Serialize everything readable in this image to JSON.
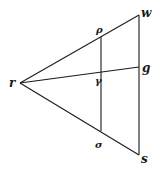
{
  "diagram": {
    "stroke_color": "#1a1a1a",
    "background": "#ffffff",
    "points": {
      "r": {
        "label": "r",
        "x": 20,
        "y": 83
      },
      "w": {
        "label": "w",
        "x": 139,
        "y": 15
      },
      "g": {
        "label": "g",
        "x": 139,
        "y": 67
      },
      "s": {
        "label": "s",
        "x": 139,
        "y": 155
      },
      "rho": {
        "label": "ρ",
        "x": 101,
        "y": 37
      },
      "gamma": {
        "label": "γ",
        "x": 101,
        "y": 72
      },
      "sigma": {
        "label": "σ",
        "x": 101,
        "y": 131
      }
    },
    "segments": [
      {
        "from": "r",
        "to": "w"
      },
      {
        "from": "r",
        "to": "g"
      },
      {
        "from": "r",
        "to": "s"
      },
      {
        "from": "w",
        "to": "s"
      },
      {
        "from": "rho",
        "to": "sigma"
      }
    ],
    "labels": {
      "r": "r",
      "w": "w",
      "rho": "ρ",
      "g": "g",
      "gamma": "γ",
      "sigma": "σ",
      "s": "s"
    }
  }
}
